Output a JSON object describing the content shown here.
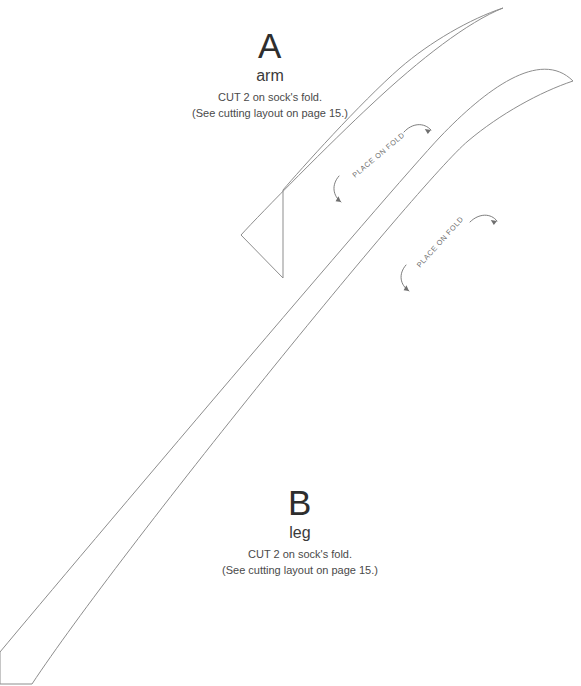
{
  "document": {
    "type": "sewing-pattern-sheet",
    "background_color": "#ffffff",
    "line_color": "#8d8d8d",
    "text_color": "#3b3b3b"
  },
  "pieces": [
    {
      "id": "piece-a",
      "letter": "A",
      "name": "arm",
      "cut_instruction": "CUT 2 on sock's fold.",
      "reference_note": "(See cutting layout on page 15.)",
      "fold_marking": "PLACE ON FOLD",
      "outline_path": "M 503 8 C 470 19 430 42 400 68 C 360 103 300 170 283 190 L 283 278 L 241 235 C 262 212 330 143 372 104 C 420 59 468 22 503 8 Z",
      "fold_line": {
        "x1": 283,
        "y1": 190,
        "x2": 503,
        "y2": 8
      }
    },
    {
      "id": "piece-b",
      "letter": "B",
      "name": "leg",
      "cut_instruction": "CUT 2 on sock's fold.",
      "reference_note": "(See cutting layout on page 15.)",
      "fold_marking": "PLACE ON FOLD",
      "outline_path": "M 573 81 C 540 92 500 114 468 141 C 420 181 120 551 32 684 L 0 684 L 0 652 C 80 556 390 190 440 137 C 485 90 540 48 573 81 Z",
      "fold_line": {
        "x1": 32,
        "y1": 684,
        "x2": 573,
        "y2": 81
      }
    }
  ],
  "fold_markings": [
    {
      "id": "fold-marking-a",
      "label": "PLACE ON FOLD",
      "text_x": 355,
      "text_y": 178,
      "rotation": -40
    },
    {
      "id": "fold-marking-b",
      "label": "PLACE ON FOLD",
      "text_x": 420,
      "text_y": 268,
      "rotation": -48
    }
  ]
}
